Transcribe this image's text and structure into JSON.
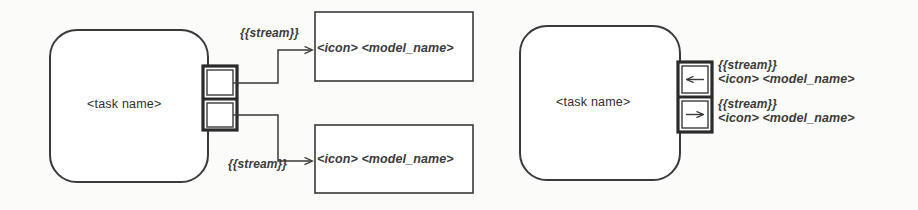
{
  "diagram": {
    "type": "uml-task-stream-port-notation",
    "background_color": "#fbfbf9",
    "stroke_color": "#3a3a3a",
    "text_color": "#333333",
    "left_example": {
      "task": {
        "name_label": "<task name>",
        "shape": "rounded-rectangle"
      },
      "ports": [
        {
          "id": "port-top",
          "arrow": "none"
        },
        {
          "id": "port-bottom",
          "arrow": "none"
        }
      ],
      "connectors": [
        {
          "id": "connector-top",
          "stream_label": "{{stream}}",
          "arrowhead": "open-arrow-right"
        },
        {
          "id": "connector-bottom",
          "stream_label": "{{stream}}",
          "arrowhead": "open-arrow-right"
        }
      ],
      "model_boxes": [
        {
          "id": "model-box-top",
          "icon_label": "<icon>",
          "model_name_label": "<model_name>",
          "text": "<icon> <model_name>"
        },
        {
          "id": "model-box-bottom",
          "icon_label": "<icon>",
          "model_name_label": "<model_name>",
          "text": "<icon> <model_name>"
        }
      ]
    },
    "right_example": {
      "task": {
        "name_label": "<task name>",
        "shape": "rounded-rectangle"
      },
      "ports": [
        {
          "id": "port-in",
          "arrow": "arrow-left",
          "stream_label": "{{stream}}",
          "model_text": "<icon> <model_name>"
        },
        {
          "id": "port-out",
          "arrow": "arrow-right",
          "stream_label": "{{stream}}",
          "model_text": "<icon> <model_name>"
        }
      ]
    }
  }
}
